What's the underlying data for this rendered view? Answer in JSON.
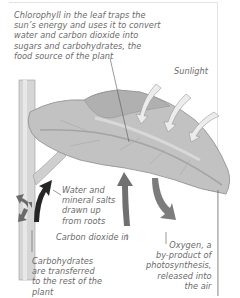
{
  "diagram": {
    "colors": {
      "leaf": "#bdbdbd",
      "leaf_shade": "#9e9e9e",
      "stem": "#d3d3d3",
      "sunlight_arrow": "#ececec",
      "co2_arrow": "#6f6f6f",
      "oxygen_arrow": "#7a7a7a",
      "water_arrow": "#2a2a2a",
      "carb_arrow": "#707070",
      "label_text": "#6a6a6a"
    },
    "labels": {
      "chlorophyll": "Chlorophyll in the leaf traps the\nsun’s energy and uses it to convert\nwater and carbon dioxide into\nsugars and carbohydrates, the\nfood source of the plant",
      "sunlight": "Sunlight",
      "water": "Water and\nmineral salts\ndrawn up\nfrom roots",
      "carbon_dioxide": "Carbon dioxide in",
      "oxygen": "Oxygen, a\nby-product of\nphotosynthesis,\nreleased into\nthe air",
      "carbohydrates": "Carbohydrates\nare transferred\nto the rest of the\nplant"
    }
  }
}
